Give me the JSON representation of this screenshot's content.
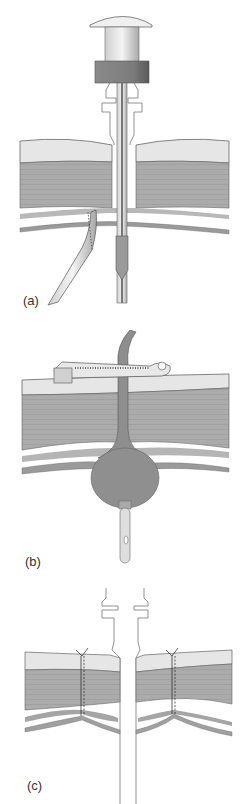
{
  "figure": {
    "panels": [
      {
        "label": "(a)",
        "description": "Trocar with cap inserted through abdominal wall layers; grasper forceps below"
      },
      {
        "label": "(b)",
        "description": "Balloon-retained tube with external ratchet clamp bolster across abdominal wall"
      },
      {
        "label": "(c)",
        "description": "Cannula through abdominal wall with sutures on both sides"
      }
    ],
    "colors": {
      "skin": "#e4e4e4",
      "muscle": "#a9a9a9",
      "muscle_lines": "#9a9a9a",
      "outline": "#555555",
      "cap_band": "#7a7a7a",
      "balloon": "#8f8f8f",
      "light_metal": "#efefef"
    }
  }
}
